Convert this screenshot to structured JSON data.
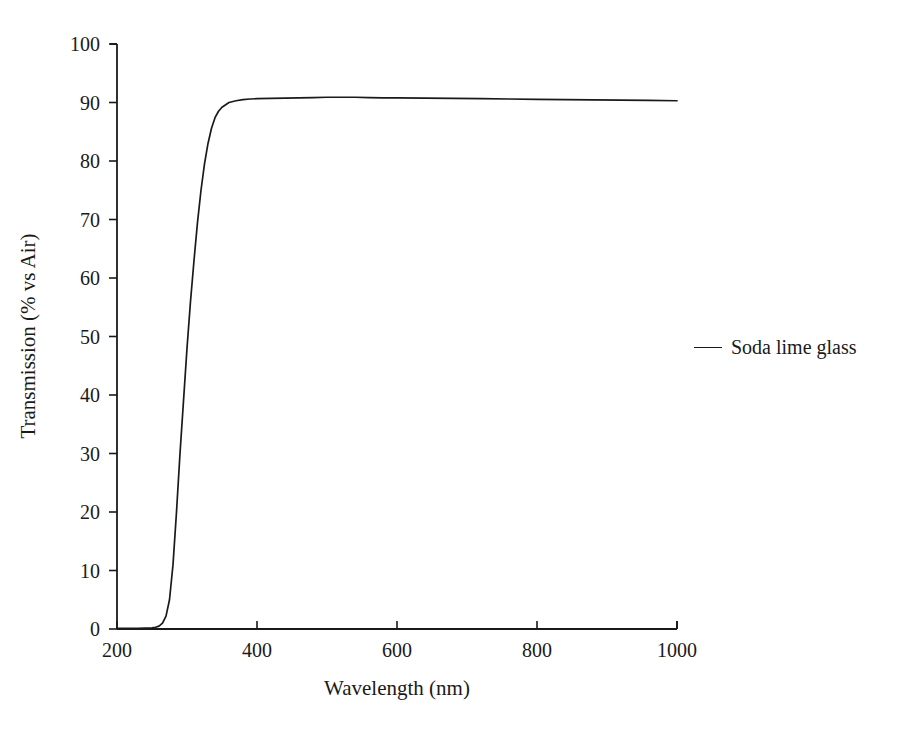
{
  "chart_data": {
    "type": "line",
    "title": "",
    "xlabel": "Wavelength (nm)",
    "ylabel": "Transmission (% vs Air)",
    "xlim": [
      200,
      1000
    ],
    "ylim": [
      0,
      100
    ],
    "xticks": [
      200,
      400,
      600,
      800,
      1000
    ],
    "yticks": [
      0,
      10,
      20,
      30,
      40,
      50,
      60,
      70,
      80,
      90,
      100
    ],
    "xtick_labels": [
      "200",
      "400",
      "600",
      "800",
      "1000"
    ],
    "ytick_labels": [
      "0",
      "10",
      "20",
      "30",
      "40",
      "50",
      "60",
      "70",
      "80",
      "90",
      "100"
    ],
    "grid": false,
    "legend_position": "right-outside",
    "legend_entries": [
      "Soda lime glass"
    ],
    "series": [
      {
        "name": "Soda lime glass",
        "color": "#1a1a1a",
        "x": [
          200,
          210,
          220,
          230,
          240,
          250,
          255,
          260,
          265,
          270,
          275,
          280,
          285,
          290,
          295,
          300,
          305,
          310,
          315,
          320,
          325,
          330,
          335,
          340,
          345,
          350,
          360,
          370,
          380,
          390,
          400,
          420,
          440,
          460,
          480,
          500,
          520,
          540,
          560,
          580,
          600,
          640,
          680,
          720,
          760,
          800,
          840,
          880,
          920,
          960,
          1000
        ],
        "y": [
          0.1,
          0.1,
          0.1,
          0.1,
          0.15,
          0.2,
          0.3,
          0.5,
          1.0,
          2.2,
          5.0,
          11.0,
          20.0,
          30.0,
          39.0,
          48.0,
          56.0,
          63.0,
          69.5,
          75.0,
          79.5,
          83.0,
          85.6,
          87.4,
          88.5,
          89.2,
          90.0,
          90.3,
          90.5,
          90.6,
          90.65,
          90.7,
          90.75,
          90.8,
          90.85,
          90.9,
          90.9,
          90.9,
          90.85,
          90.8,
          90.8,
          90.75,
          90.7,
          90.65,
          90.6,
          90.55,
          90.5,
          90.45,
          90.4,
          90.35,
          90.3
        ]
      }
    ]
  },
  "axes": {
    "x_title": "Wavelength (nm)",
    "y_title": "Transmission (% vs Air)"
  },
  "legend": {
    "label": "Soda lime glass"
  }
}
